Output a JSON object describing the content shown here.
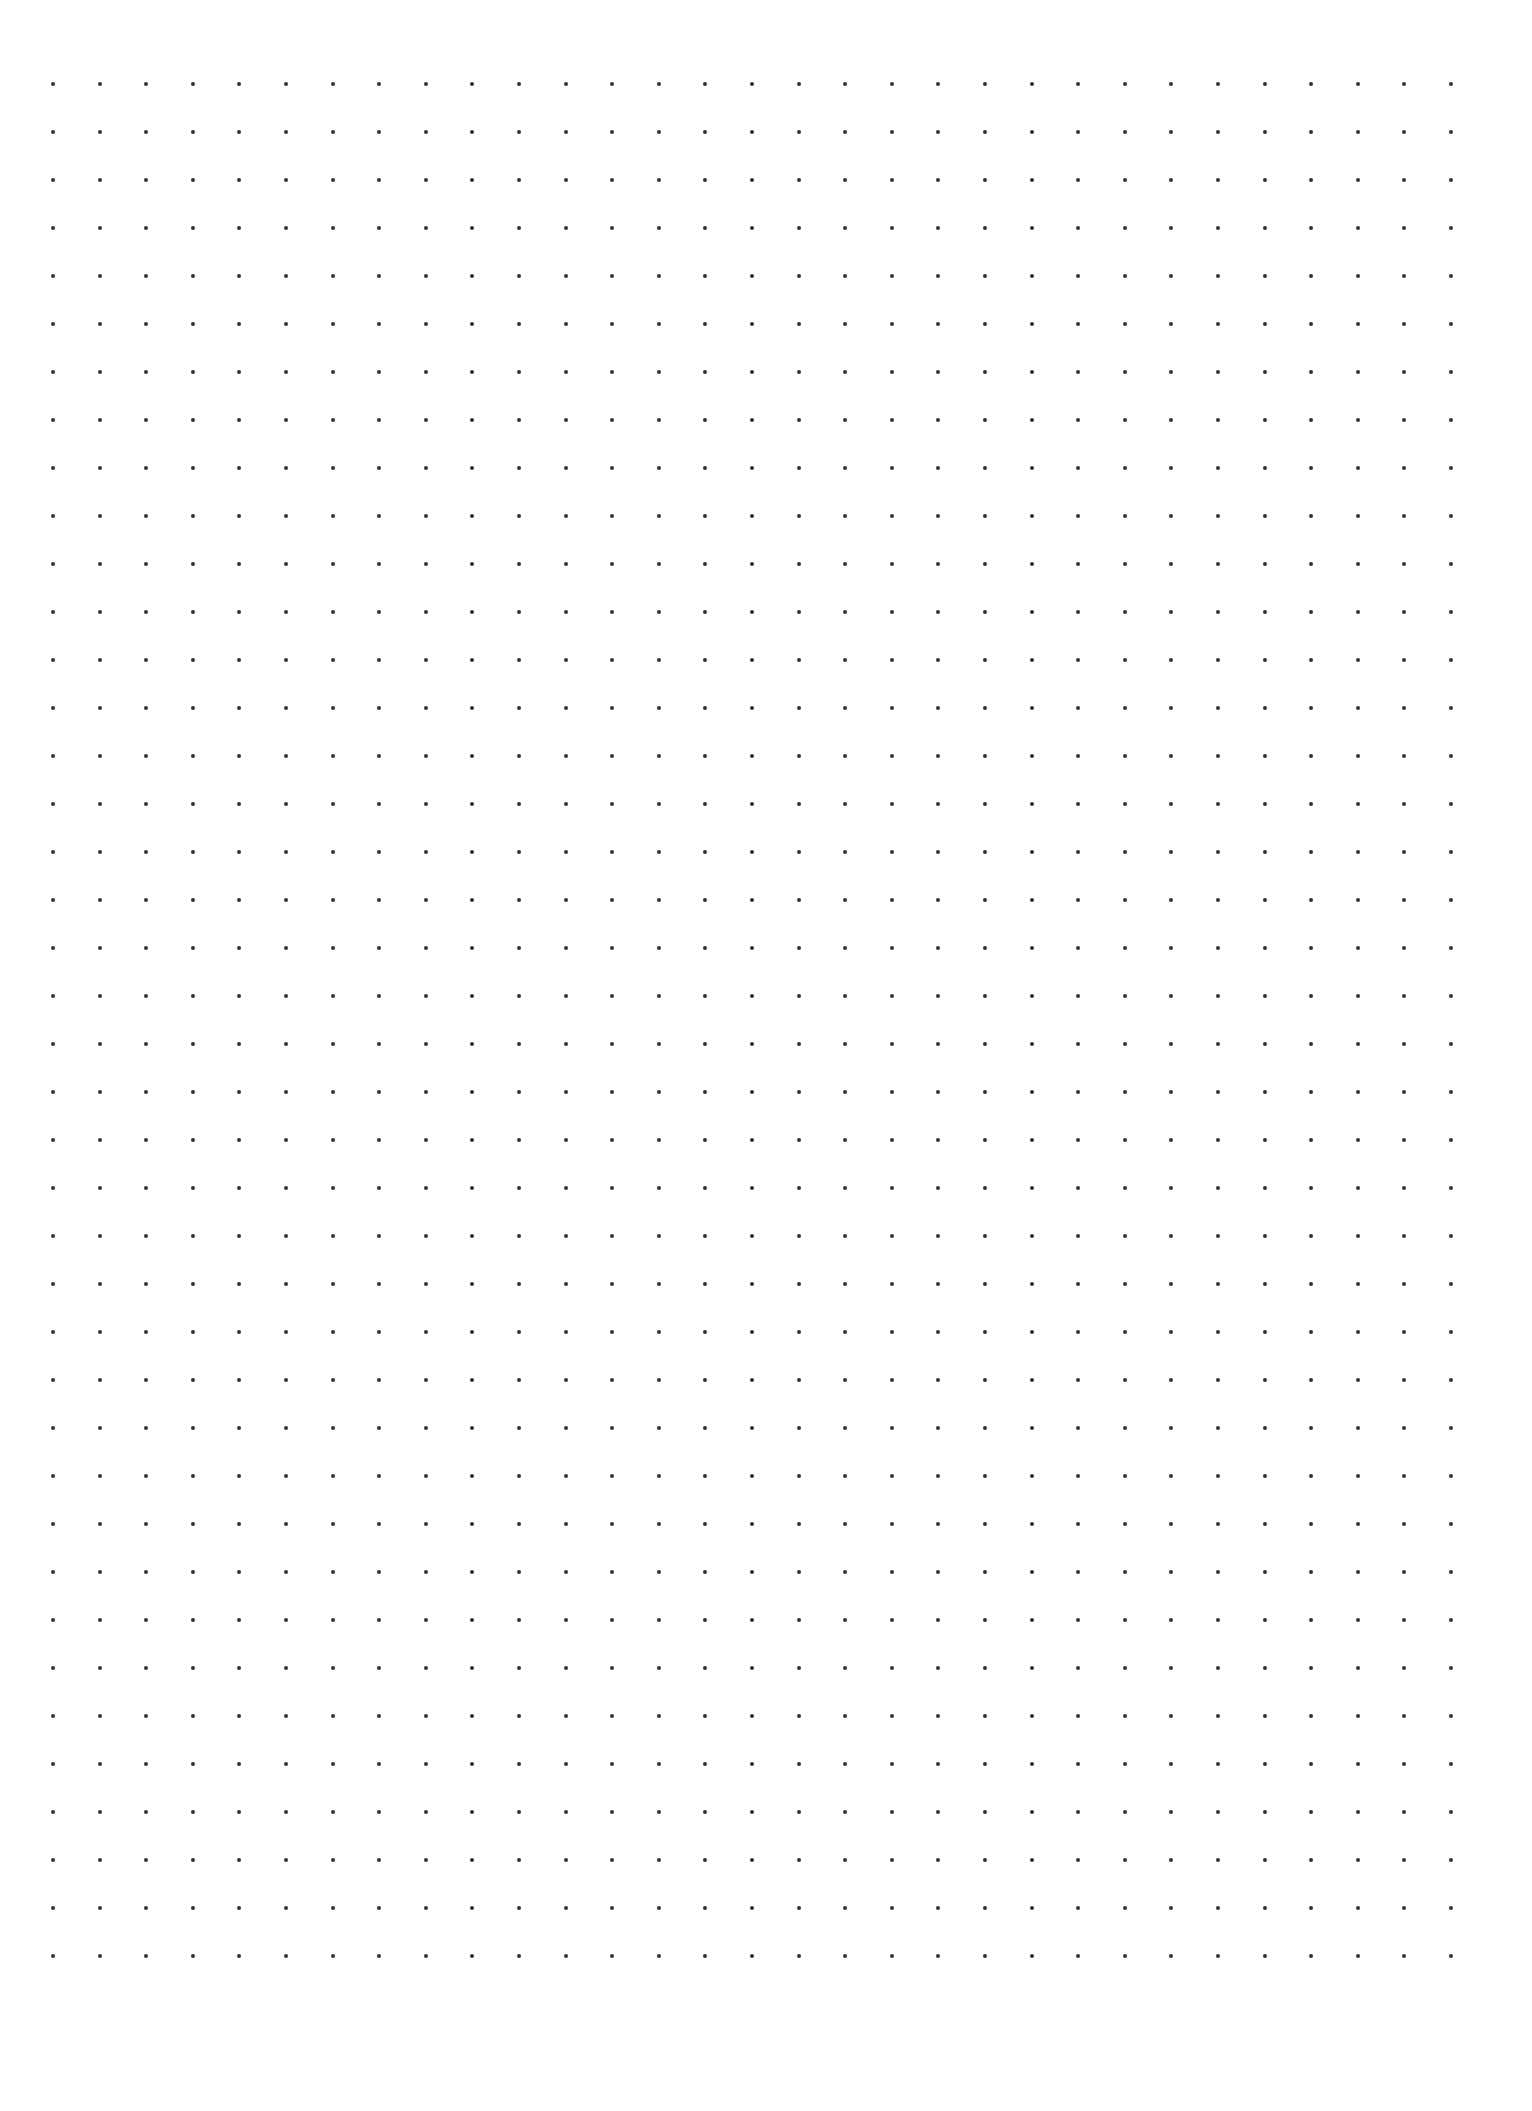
{
  "page": {
    "type": "dot-grid-paper",
    "background_color": "#ffffff",
    "dot_color": "#333333"
  },
  "grid": {
    "columns": 31,
    "rows": 40,
    "origin_x": 53,
    "origin_y": 84,
    "spacing_x": 46.6,
    "spacing_y": 48,
    "dot_diameter": 4
  }
}
